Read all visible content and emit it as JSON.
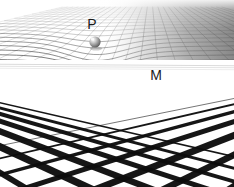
{
  "figure": {
    "width": 234,
    "height": 187,
    "background_color": "#ffffff"
  },
  "labels": [
    {
      "id": "P",
      "text": "P",
      "x": 92,
      "y": 29,
      "font_size": 14,
      "color": "#1a1a1a",
      "refers_to": "sphere-particle"
    },
    {
      "id": "M",
      "text": "M",
      "x": 156,
      "y": 80,
      "font_size": 14,
      "color": "#1a1a1a",
      "refers_to": "flat-grid-plane"
    }
  ],
  "sphere": {
    "name": "particle-sphere",
    "center_x": 95,
    "center_y": 42,
    "radius": 5.6,
    "fill_light": "#f2f2f2",
    "fill_mid": "#9a9a9a",
    "fill_dark": "#4f4f4f",
    "highlight_x": 92.5,
    "highlight_y": 39
  },
  "curved_surface": {
    "name": "curved-mesh-surface",
    "horizon_y": 61,
    "top_y": 7,
    "well_center_x": 97,
    "well_center_y": 44,
    "well_radius_x": 58,
    "well_depth": 17,
    "u_lines": 30,
    "v_lines": 22,
    "line_color": "#6e6e6e",
    "line_color_dark": "#343434",
    "shade_left": "#fcfcfc",
    "shade_right": "#8c8c8c",
    "shade_far_right": "#636363"
  },
  "flat_grid": {
    "name": "flat-perspective-grid",
    "horizon_y": 63,
    "bottom_y": 187,
    "line_color": "#0d0d0d",
    "fill_color": "#ffffff",
    "vanishing_point_left_x": -190,
    "vanishing_point_right_x": 430,
    "vanishing_point_y": 59,
    "left_family_count": 9,
    "right_family_count": 9,
    "min_line_width": 0.55,
    "max_line_width": 7.5
  },
  "colors": {
    "ink": "#0d0d0d",
    "mesh": "#6e6e6e",
    "paper": "#ffffff",
    "sphere": "#9a9a9a"
  }
}
